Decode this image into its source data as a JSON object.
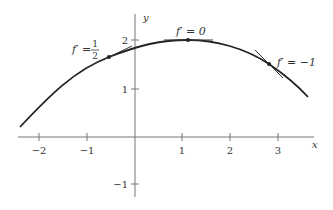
{
  "figure": {
    "type": "function graph with tangent lines",
    "axes": {
      "x_label": "x",
      "y_label": "y",
      "x_ticks": [
        {
          "value": -2,
          "label": "−2"
        },
        {
          "value": -1,
          "label": "−1"
        },
        {
          "value": 1,
          "label": "1"
        },
        {
          "value": 2,
          "label": "2"
        },
        {
          "value": 3,
          "label": "3"
        }
      ],
      "y_ticks": [
        {
          "value": 2,
          "label": "2"
        },
        {
          "value": 1,
          "label": "1"
        },
        {
          "value": -1,
          "label": "−1"
        }
      ],
      "x_range": [
        -2.4,
        3.8
      ],
      "y_range": [
        -1.5,
        2.6
      ]
    },
    "curve": {
      "description": "concave-down curve with maximum near x≈1.1, y=2",
      "points": [
        [
          -2.4,
          0.2
        ],
        [
          -1.5,
          0.95
        ],
        [
          -0.5,
          1.65
        ],
        [
          0.3,
          1.94
        ],
        [
          1.1,
          2.0
        ],
        [
          2.0,
          1.85
        ],
        [
          2.8,
          1.5
        ],
        [
          3.6,
          0.83
        ]
      ]
    },
    "tangents": [
      {
        "label_prefix": "f′ = ",
        "label_num": "1",
        "label_den": "2",
        "x": -0.55,
        "y": 1.65,
        "slope": 0.5
      },
      {
        "label": "f′ = 0",
        "x": 1.1,
        "y": 2.0,
        "slope": 0
      },
      {
        "label": "f′ = −1",
        "x": 2.8,
        "y": 1.5,
        "slope": -1
      }
    ]
  }
}
